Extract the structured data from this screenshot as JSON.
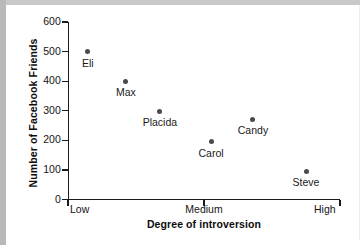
{
  "chart_data": {
    "type": "scatter",
    "title": "",
    "xlabel": "Degree of introversion",
    "ylabel": "Number of  Facebook Friends",
    "ylim": [
      0,
      600
    ],
    "yticks": [
      0,
      100,
      200,
      300,
      400,
      500,
      600
    ],
    "ytick_labels": [
      "0",
      "100",
      "200",
      "300",
      "400",
      "500",
      "600"
    ],
    "xtick_labels": [
      "Low",
      "Medium",
      "High"
    ],
    "x_axis_kind": "ordinal-scale",
    "grid": false,
    "legend": null,
    "points": [
      {
        "label": "Eli",
        "x_frac": 0.073,
        "y": 500
      },
      {
        "label": "Max",
        "x_frac": 0.213,
        "y": 400
      },
      {
        "label": "Placida",
        "x_frac": 0.338,
        "y": 298
      },
      {
        "label": "Carol",
        "x_frac": 0.526,
        "y": 195
      },
      {
        "label": "Candy",
        "x_frac": 0.68,
        "y": 272
      },
      {
        "label": "Steve",
        "x_frac": 0.875,
        "y": 95
      }
    ]
  },
  "colors": {
    "marker": "#4a4a4a",
    "axis": "#1a1a1a",
    "text": "#141414",
    "background": "#ffffff",
    "frame_shadow": "#b9b9b9"
  }
}
